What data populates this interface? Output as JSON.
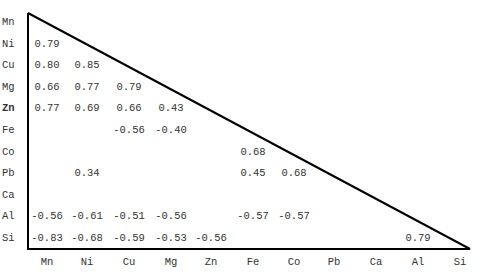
{
  "chart_data": {
    "type": "table",
    "title": "",
    "variables": [
      "Mn",
      "Ni",
      "Cu",
      "Mg",
      "Zn",
      "Fe",
      "Co",
      "Pb",
      "Ca",
      "Al",
      "Si"
    ],
    "row_labels": [
      "Mn",
      "Ni",
      "Cu",
      "Mg",
      "Zn",
      "Fe",
      "Co",
      "Pb",
      "Ca",
      "Al",
      "Si"
    ],
    "col_labels": [
      "Mn",
      "Ni",
      "Cu",
      "Mg",
      "Zn",
      "Fe",
      "Co",
      "Pb",
      "Ca",
      "Al",
      "Si"
    ],
    "bold_rows": [
      "Zn"
    ],
    "cells": [
      {
        "row": "Ni",
        "col": "Mn",
        "value": "0.79"
      },
      {
        "row": "Cu",
        "col": "Mn",
        "value": "0.80"
      },
      {
        "row": "Cu",
        "col": "Ni",
        "value": "0.85"
      },
      {
        "row": "Mg",
        "col": "Mn",
        "value": "0.66"
      },
      {
        "row": "Mg",
        "col": "Ni",
        "value": "0.77"
      },
      {
        "row": "Mg",
        "col": "Cu",
        "value": "0.79"
      },
      {
        "row": "Zn",
        "col": "Mn",
        "value": "0.77"
      },
      {
        "row": "Zn",
        "col": "Ni",
        "value": "0.69"
      },
      {
        "row": "Zn",
        "col": "Cu",
        "value": "0.66"
      },
      {
        "row": "Zn",
        "col": "Mg",
        "value": "0.43"
      },
      {
        "row": "Fe",
        "col": "Cu",
        "value": "-0.56"
      },
      {
        "row": "Fe",
        "col": "Mg",
        "value": "-0.40"
      },
      {
        "row": "Co",
        "col": "Fe",
        "value": "0.68"
      },
      {
        "row": "Pb",
        "col": "Ni",
        "value": "0.34"
      },
      {
        "row": "Pb",
        "col": "Fe",
        "value": "0.45"
      },
      {
        "row": "Pb",
        "col": "Co",
        "value": "0.68"
      },
      {
        "row": "Al",
        "col": "Mn",
        "value": "-0.56"
      },
      {
        "row": "Al",
        "col": "Ni",
        "value": "-0.61"
      },
      {
        "row": "Al",
        "col": "Cu",
        "value": "-0.51"
      },
      {
        "row": "Al",
        "col": "Mg",
        "value": "-0.56"
      },
      {
        "row": "Al",
        "col": "Fe",
        "value": "-0.57"
      },
      {
        "row": "Al",
        "col": "Co",
        "value": "-0.57"
      },
      {
        "row": "Si",
        "col": "Mn",
        "value": "-0.83"
      },
      {
        "row": "Si",
        "col": "Ni",
        "value": "-0.68"
      },
      {
        "row": "Si",
        "col": "Cu",
        "value": "-0.59"
      },
      {
        "row": "Si",
        "col": "Mg",
        "value": "-0.53"
      },
      {
        "row": "Si",
        "col": "Zn",
        "value": "-0.56"
      },
      {
        "row": "Si",
        "col": "Al",
        "value": "0.79"
      }
    ],
    "layout": {
      "triangle": {
        "top_left": [
          28,
          13
        ],
        "bottom_left": [
          28,
          249
        ],
        "bottom_right": [
          470,
          249
        ]
      },
      "row_y": [
        22,
        44,
        65,
        87,
        108,
        130,
        152,
        173,
        195,
        216,
        238
      ],
      "col_x": [
        47,
        87,
        129,
        171,
        211,
        253,
        294,
        334,
        376,
        418,
        460
      ],
      "line_color": "#000000",
      "text_color": "#333333"
    }
  }
}
